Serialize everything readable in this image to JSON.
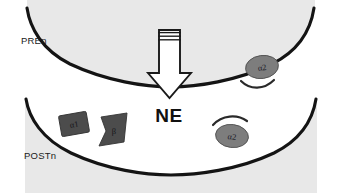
{
  "diagram": {
    "colors": {
      "membrane_line": "#141414",
      "cell_fill": "#e7e7e7",
      "cleft_fill": "#ffffff",
      "receptor_dark": "#4c4c4c",
      "receptor_mid": "#7d7d7d",
      "arrow_fill": "#ffffff",
      "arrow_stroke": "#1a1a1a",
      "text": "#1b1b1b",
      "background": "#ffffff"
    },
    "presynaptic": {
      "label": "PREn",
      "label_name": "presynaptic-neuron-label"
    },
    "postsynaptic": {
      "label": "POSTn",
      "label_name": "postsynaptic-neuron-label"
    },
    "transmitter": {
      "label": "NE",
      "arrow_name": "release-arrow"
    },
    "receptors": [
      {
        "id": "pre-alpha2",
        "label": "α2",
        "shape": "ellipse",
        "location": "presynaptic-membrane"
      },
      {
        "id": "post-alpha1",
        "label": "α1",
        "shape": "rectangle",
        "location": "postsynaptic-membrane"
      },
      {
        "id": "post-beta",
        "label": "β",
        "shape": "bowtie",
        "location": "postsynaptic-membrane"
      },
      {
        "id": "post-alpha2",
        "label": "α2",
        "shape": "ellipse",
        "location": "postsynaptic-membrane"
      }
    ],
    "arcs": [
      {
        "id": "pre-alpha2-arc",
        "description": "curved arc below presynaptic alpha2 receptor"
      },
      {
        "id": "post-alpha2-arc",
        "description": "curved arc above postsynaptic alpha2 receptor"
      }
    ]
  }
}
